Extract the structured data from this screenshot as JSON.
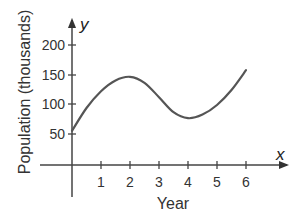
{
  "chart_data": {
    "type": "line",
    "title": "",
    "xlabel": "Year",
    "ylabel": "Population (thousands)",
    "x_axis_variable": "x",
    "y_axis_variable": "y",
    "x_ticks": [
      "1",
      "2",
      "3",
      "4",
      "5",
      "6"
    ],
    "y_ticks": [
      "50",
      "100",
      "150",
      "200"
    ],
    "xlim": [
      0,
      6.8
    ],
    "ylim": [
      0,
      220
    ],
    "grid": false,
    "legend": null,
    "series": [
      {
        "name": "Population",
        "x": [
          0,
          0.5,
          1,
          1.5,
          2,
          2.5,
          3,
          3.5,
          4,
          4.5,
          5,
          5.5,
          6
        ],
        "values": [
          57,
          95,
          123,
          141,
          147,
          137,
          113,
          88,
          78,
          84,
          100,
          125,
          158
        ]
      }
    ]
  },
  "labels": {
    "xlabel": "Year",
    "ylabel": "Population (thousands)",
    "x_var": "x",
    "y_var": "y",
    "x_ticks": [
      "1",
      "2",
      "3",
      "4",
      "5",
      "6"
    ],
    "y_ticks": [
      "50",
      "100",
      "150",
      "200"
    ]
  }
}
